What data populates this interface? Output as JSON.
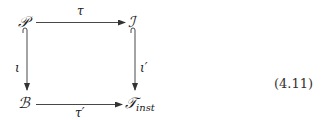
{
  "diagram": {
    "type": "commutative-square",
    "nodes": {
      "top_left": {
        "symbol": "𝒫",
        "sub": ""
      },
      "top_right": {
        "symbol": "ℐ",
        "sub": ""
      },
      "bottom_left": {
        "symbol": "ℬ",
        "sub": ""
      },
      "bottom_right": {
        "symbol": "𝒯",
        "sub": "inst"
      }
    },
    "arrows": {
      "top": {
        "label": "τ",
        "from": "top_left",
        "to": "top_right",
        "kind": "plain"
      },
      "bottom": {
        "label": "τ′",
        "from": "bottom_left",
        "to": "bottom_right",
        "kind": "plain"
      },
      "left": {
        "label": "ι",
        "from": "top_left",
        "to": "bottom_left",
        "kind": "hook-inclusion"
      },
      "right": {
        "label": "ι′",
        "from": "top_right",
        "to": "bottom_right",
        "kind": "hook-inclusion"
      }
    },
    "equation_number": "(4.11)",
    "colors": {
      "ink": "#1a1a1a",
      "arrow": "#333333",
      "background": "#ffffff"
    }
  }
}
